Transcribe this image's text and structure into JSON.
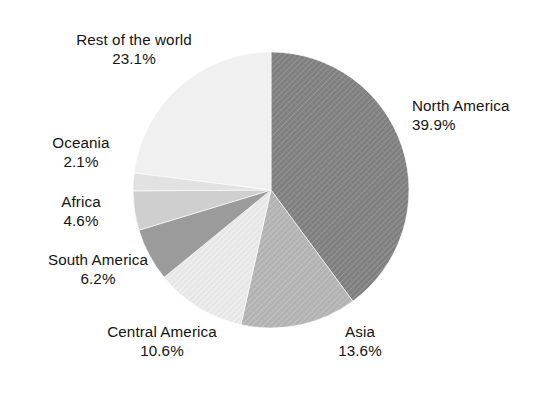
{
  "figure": {
    "background_color": "#ffffff",
    "text_color": "#141414"
  },
  "chart_data": {
    "type": "pie",
    "title": "",
    "subtitle": "",
    "xlabel": "",
    "ylabel": "",
    "legend_position": "none",
    "grid": false,
    "value_unit": "percent",
    "start_angle_deg": 0,
    "direction": "clockwise",
    "center": {
      "x": 271,
      "y": 190
    },
    "radius": 138,
    "categories": [
      "North America",
      "Asia",
      "Central America",
      "South America",
      "Africa",
      "Oceania",
      "Rest of the world"
    ],
    "values": [
      39.9,
      13.6,
      10.6,
      6.2,
      4.6,
      2.1,
      23.1
    ],
    "slices": [
      {
        "label": "North America",
        "value": 39.9,
        "value_text": "39.9%",
        "color": "#7f7f7f",
        "hatch": "diagonal",
        "hatch_color": "#9a9a9a",
        "start_angle_deg": 0.0,
        "end_angle_deg": 143.64
      },
      {
        "label": "Asia",
        "value": 13.6,
        "value_text": "13.6%",
        "color": "#b2b2b2",
        "hatch": "diagonal",
        "hatch_color": "#c6c6c6",
        "start_angle_deg": 143.64,
        "end_angle_deg": 192.6
      },
      {
        "label": "Central America",
        "value": 10.6,
        "value_text": "10.6%",
        "color": "#e9e9e9",
        "hatch": "diagonal",
        "hatch_color": "#f6f6f6",
        "start_angle_deg": 192.6,
        "end_angle_deg": 230.76
      },
      {
        "label": "South America",
        "value": 6.2,
        "value_text": "6.2%",
        "color": "#9b9b9b",
        "hatch": "none",
        "hatch_color": "#9b9b9b",
        "start_angle_deg": 230.76,
        "end_angle_deg": 253.08
      },
      {
        "label": "Africa",
        "value": 4.6,
        "value_text": "4.6%",
        "color": "#cfcfcf",
        "hatch": "none",
        "hatch_color": "#cfcfcf",
        "start_angle_deg": 253.08,
        "end_angle_deg": 269.64
      },
      {
        "label": "Oceania",
        "value": 2.1,
        "value_text": "2.1%",
        "color": "#e2e2e2",
        "hatch": "none",
        "hatch_color": "#e2e2e2",
        "start_angle_deg": 269.64,
        "end_angle_deg": 277.2
      },
      {
        "label": "Rest of the world",
        "value": 23.1,
        "value_text": "23.1%",
        "color": "#f0f0f0",
        "hatch": "none",
        "hatch_color": "#f0f0f0",
        "start_angle_deg": 277.2,
        "end_angle_deg": 360.0
      }
    ]
  },
  "labels": {
    "rest_of_the_world": {
      "name": "Rest of the world",
      "percent": "23.1%"
    },
    "oceania": {
      "name": "Oceania",
      "percent": "2.1%"
    },
    "africa": {
      "name": "Africa",
      "percent": "4.6%"
    },
    "south_america": {
      "name": "South America",
      "percent": "6.2%"
    },
    "central_america": {
      "name": "Central America",
      "percent": "10.6%"
    },
    "asia": {
      "name": "Asia",
      "percent": "13.6%"
    },
    "north_america": {
      "name": "North America",
      "percent": "39.9%"
    }
  }
}
